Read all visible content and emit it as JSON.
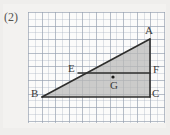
{
  "problem": {
    "number": "(2)"
  },
  "figure": {
    "type": "geometry-diagram",
    "background_color": "#fbfbfa",
    "grid_color": "#96a0af",
    "stroke_color": "#2e2e2c",
    "fill_color": "#b9b9b7",
    "points": [
      {
        "name": "A",
        "label": "A",
        "x": 150,
        "y": 39,
        "label_x": 145,
        "label_y": 25
      },
      {
        "name": "B",
        "label": "B",
        "x": 42,
        "y": 97,
        "label_x": 31,
        "label_y": 88
      },
      {
        "name": "C",
        "label": "C",
        "x": 150,
        "y": 97,
        "label_x": 152,
        "label_y": 88
      },
      {
        "name": "E",
        "label": "E",
        "x": 78,
        "y": 73,
        "label_x": 68,
        "label_y": 63
      },
      {
        "name": "F",
        "label": "F",
        "x": 150,
        "y": 73,
        "label_x": 153,
        "label_y": 64
      },
      {
        "name": "G",
        "label": "G",
        "x": 113,
        "y": 77,
        "label_x": 110,
        "label_y": 80
      }
    ],
    "segments": [
      {
        "name": "BA",
        "from": "B",
        "to": "A"
      },
      {
        "name": "AC",
        "from": "A",
        "to": "C"
      },
      {
        "name": "BC",
        "from": "B",
        "to": "C"
      },
      {
        "name": "EF",
        "from": "E",
        "to": "F"
      }
    ],
    "shaded_regions": [
      {
        "name": "triangle-ABC",
        "vertices": [
          "A",
          "B",
          "C"
        ]
      }
    ],
    "marked_points": [
      {
        "name": "G",
        "x": 113,
        "y": 77,
        "radius": 1.6
      }
    ]
  }
}
